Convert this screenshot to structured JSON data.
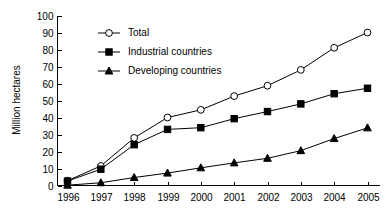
{
  "chart_data": {
    "type": "line",
    "title": "",
    "xlabel": "",
    "ylabel": "Million hectares",
    "categories": [
      "1996",
      "1997",
      "1998",
      "1999",
      "2000",
      "2001",
      "2002",
      "2003",
      "2004",
      "2005"
    ],
    "x": [
      1996,
      1997,
      1998,
      1999,
      2000,
      2001,
      2002,
      2003,
      2004,
      2005
    ],
    "series": [
      {
        "name": "Total",
        "marker": "open-circle",
        "values": [
          2.8,
          11.5,
          28.0,
          40.0,
          44.5,
          52.6,
          58.7,
          68.0,
          81.0,
          90.0
        ]
      },
      {
        "name": "Industrial countries",
        "marker": "filled-square",
        "values": [
          2.6,
          9.6,
          24.0,
          33.0,
          34.0,
          39.3,
          43.5,
          48.0,
          54.0,
          57.2
        ]
      },
      {
        "name": "Developing countries",
        "marker": "filled-triangle",
        "values": [
          0.2,
          1.6,
          4.7,
          7.3,
          10.4,
          13.3,
          16.0,
          20.5,
          27.6,
          33.9
        ]
      }
    ],
    "ylim": [
      0,
      100
    ],
    "yticks": [
      0,
      10,
      20,
      30,
      40,
      50,
      60,
      70,
      80,
      90,
      100
    ],
    "ytick_labels": [
      "0",
      "10",
      "20",
      "30",
      "40",
      "50",
      "60",
      "70",
      "80",
      "90",
      "100"
    ],
    "grid": false,
    "legend_position": "upper-left-inside",
    "colors": {
      "axis": "#000000",
      "line": "#000000",
      "marker_fill": "#000000",
      "marker_open_fill": "#ffffff",
      "background": "#ffffff"
    }
  },
  "legend": {
    "items": [
      {
        "label": "Total"
      },
      {
        "label": "Industrial countries"
      },
      {
        "label": "Developing countries"
      }
    ]
  }
}
